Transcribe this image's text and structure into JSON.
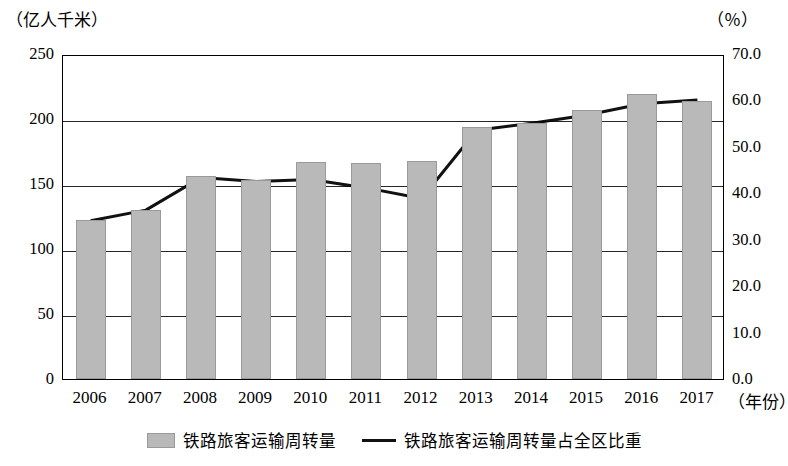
{
  "units": {
    "left": "（亿人千米）",
    "right": "（％）",
    "x": "（年份）"
  },
  "legend": [
    {
      "label": "铁路旅客运输周转量",
      "type": "bar",
      "color": "#b9b9b9"
    },
    {
      "label": "铁路旅客运输周转量占全区比重",
      "type": "line",
      "color": "#111111"
    }
  ],
  "chart_data": {
    "type": "bar",
    "title": "",
    "xlabel": "（年份）",
    "ylabel": "（亿人千米）",
    "y2label": "（％）",
    "categories": [
      "2006",
      "2007",
      "2008",
      "2009",
      "2010",
      "2011",
      "2012",
      "2013",
      "2014",
      "2015",
      "2016",
      "2017"
    ],
    "ylim": [
      0,
      250
    ],
    "yticks": [
      "0",
      "50",
      "100",
      "150",
      "200",
      "250"
    ],
    "y2lim": [
      0,
      70
    ],
    "y2ticks": [
      "0.0",
      "10.0",
      "20.0",
      "30.0",
      "40.0",
      "50.0",
      "60.0",
      "70.0"
    ],
    "grid": true,
    "legend_position": "bottom",
    "series": [
      {
        "name": "铁路旅客运输周转量",
        "type": "bar",
        "axis": "left",
        "color": "#b9b9b9",
        "values": [
          122,
          130,
          156,
          153,
          167,
          166,
          168,
          194,
          197,
          207,
          219,
          214
        ]
      },
      {
        "name": "铁路旅客运输周转量占全区比重",
        "type": "line",
        "axis": "right",
        "color": "#111111",
        "values": [
          34.5,
          36.8,
          43.8,
          43.0,
          43.4,
          41.6,
          39.3,
          54.0,
          55.5,
          57.3,
          59.7,
          60.5
        ]
      }
    ]
  }
}
